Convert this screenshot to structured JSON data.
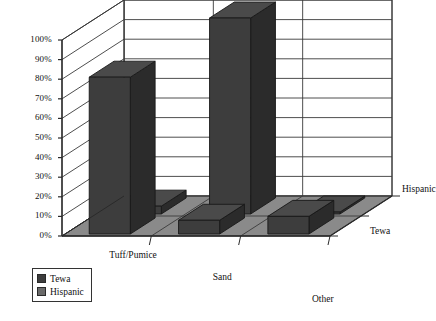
{
  "chart_data": {
    "type": "bar",
    "title": "",
    "subtitle": "",
    "xlabel": "",
    "ylabel": "",
    "zlabel": "",
    "categories": [
      "Tuff/Pumice",
      "Sand",
      "Other"
    ],
    "series": [
      {
        "name": "Tewa",
        "values": [
          80,
          7,
          9
        ]
      },
      {
        "name": "Hispanic",
        "values": [
          4,
          100,
          1
        ]
      }
    ],
    "ylim": [
      0,
      100
    ],
    "yticks": [
      "0%",
      "10%",
      "20%",
      "30%",
      "40%",
      "50%",
      "60%",
      "70%",
      "80%",
      "90%",
      "100%"
    ],
    "ytick_values": [
      0,
      10,
      20,
      30,
      40,
      50,
      60,
      70,
      80,
      90,
      100
    ],
    "depth_axis_labels": [
      "Hispanic",
      "Tewa"
    ],
    "grid": true,
    "legend_position": "bottom-left",
    "legend_entries": [
      "Tewa",
      "Hispanic"
    ],
    "colors": {
      "bar_front": "#3d3d3d",
      "bar_top": "#4a4a4a",
      "bar_side": "#2b2b2b",
      "floor": "#8a8a8a",
      "wall": "#ffffff",
      "axis_line": "#2a2a2a",
      "grid_line": "#3a3a3a",
      "legend_swatch_tewa": "#3d3d3d",
      "legend_swatch_hispanic": "#6a6a6a"
    }
  },
  "axis": {
    "y_ticks": [
      "100%",
      "90%",
      "80%",
      "70%",
      "60%",
      "50%",
      "40%",
      "30%",
      "20%",
      "10%",
      "0%"
    ],
    "categories": [
      "Tuff/Pumice",
      "Sand",
      "Other"
    ],
    "depth": [
      "Hispanic",
      "Tewa"
    ]
  },
  "legend": {
    "items": [
      {
        "label": "Tewa"
      },
      {
        "label": "Hispanic"
      }
    ]
  }
}
